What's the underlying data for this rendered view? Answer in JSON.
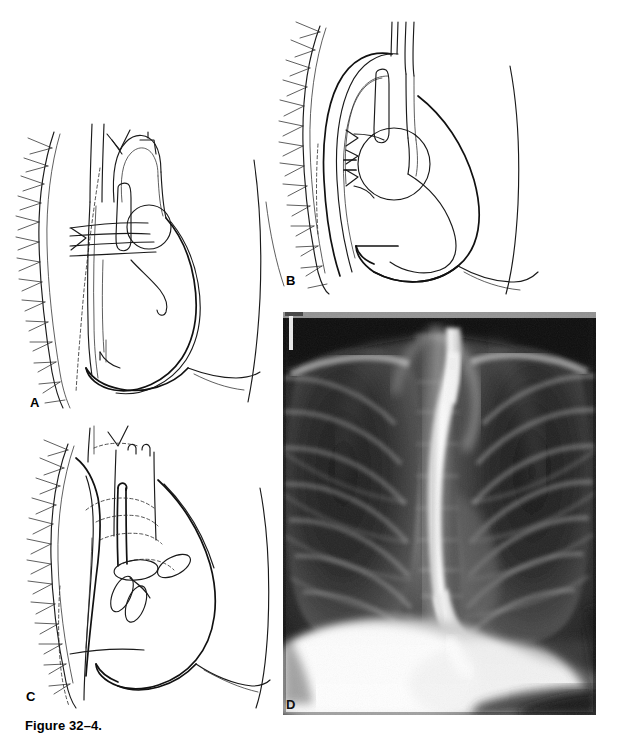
{
  "figure": {
    "caption": "Figure 32–4.",
    "running_head": "",
    "page_background": "#ffffff",
    "ink_color": "#1a1a1a"
  },
  "panels": [
    {
      "id": "A",
      "label": "A",
      "type": "line-drawing",
      "description": "Lateral chest line drawing: normal mediastinum with thoracic spine and ribs at left, anterior chest wall at right, trachea and aortic arch, right pulmonary artery shown as a circle, and the cardiac silhouette with diaphragm."
    },
    {
      "id": "B",
      "label": "B",
      "type": "line-drawing",
      "description": "Lateral chest line drawing: markedly dilated and tortuous thoracic aorta arching over the left main bronchus, with posterior descending aorta displacing structures; heart and diaphragm outlined."
    },
    {
      "id": "C",
      "label": "C",
      "type": "line-drawing",
      "description": "Lateral chest line drawing with dashed (hidden) outlines indicating the barium-filled esophagus and mediastinal vessels projected over the cardiac silhouette."
    },
    {
      "id": "D",
      "label": "D",
      "type": "radiograph",
      "description": "Posteroanterior chest radiograph with barium-filled esophagus seen as a bright vertical column in the mediastinum, both lung fields, ribs, and the elevated diaphragm with gastric air-fluid density below."
    }
  ],
  "radiograph": {
    "modality_hint": "chest-radiograph",
    "contrast_feature": "barium-filled esophagus",
    "visible_structures": [
      "right lung field",
      "left lung field",
      "thoracic spine",
      "ribs",
      "mediastinum",
      "barium esophageal column",
      "diaphragm",
      "cardiac border"
    ],
    "corner_marker": "white vertical marker at upper left"
  }
}
